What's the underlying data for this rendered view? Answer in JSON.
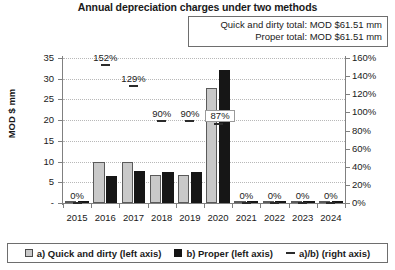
{
  "chart_data": {
    "type": "bar",
    "title": "Annual depreciation charges under two methods",
    "xlabel": "",
    "ylabel": "MOD $ mm",
    "ylabel_right": "",
    "categories": [
      "2015",
      "2016",
      "2017",
      "2018",
      "2019",
      "2020",
      "2021",
      "2022",
      "2023",
      "2024"
    ],
    "series": [
      {
        "name": "a) Quick and dirty (left axis)",
        "type": "bar",
        "axis": "left",
        "color": "#c9c9c9",
        "values": [
          0,
          9.9,
          9.9,
          6.8,
          6.8,
          27.8,
          0,
          0,
          0,
          0
        ]
      },
      {
        "name": "b) Proper (left axis)",
        "type": "bar",
        "axis": "left",
        "color": "#161616",
        "values": [
          0,
          6.5,
          7.7,
          7.6,
          7.6,
          32.0,
          0,
          0,
          0,
          0
        ]
      },
      {
        "name": "a)/b) (right axis)",
        "type": "line",
        "axis": "right",
        "color": "#2b2b2b",
        "values": [
          0,
          152,
          129,
          90,
          90,
          87,
          0,
          0,
          0,
          0
        ],
        "labels": [
          "0%",
          "152%",
          "129%",
          "90%",
          "90%",
          "87%",
          "0%",
          "0%",
          "0%",
          "0%"
        ]
      }
    ],
    "ylim": [
      0,
      35
    ],
    "yticks": [
      "-",
      "5",
      "10",
      "15",
      "20",
      "25",
      "30",
      "35"
    ],
    "ytick_values": [
      0,
      5,
      10,
      15,
      20,
      25,
      30,
      35
    ],
    "ylim_right": [
      0,
      160
    ],
    "yticks_right": [
      "0%",
      "20%",
      "40%",
      "60%",
      "80%",
      "100%",
      "120%",
      "140%",
      "160%"
    ],
    "ytick_values_right": [
      0,
      20,
      40,
      60,
      80,
      100,
      120,
      140,
      160
    ],
    "grid": true,
    "legend_position": "bottom"
  },
  "totals": {
    "quick_and_dirty": "Quick and dirty total: MOD $61.51 mm",
    "proper": "Proper total: MOD $61.51 mm"
  },
  "legend": {
    "items": [
      {
        "label": "a) Quick and dirty (left axis)",
        "marker": "square-filled-gray"
      },
      {
        "label": "b) Proper (left axis)",
        "marker": "square-filled-black"
      },
      {
        "label": "a)/b) (right axis)",
        "marker": "line-dash"
      }
    ]
  }
}
